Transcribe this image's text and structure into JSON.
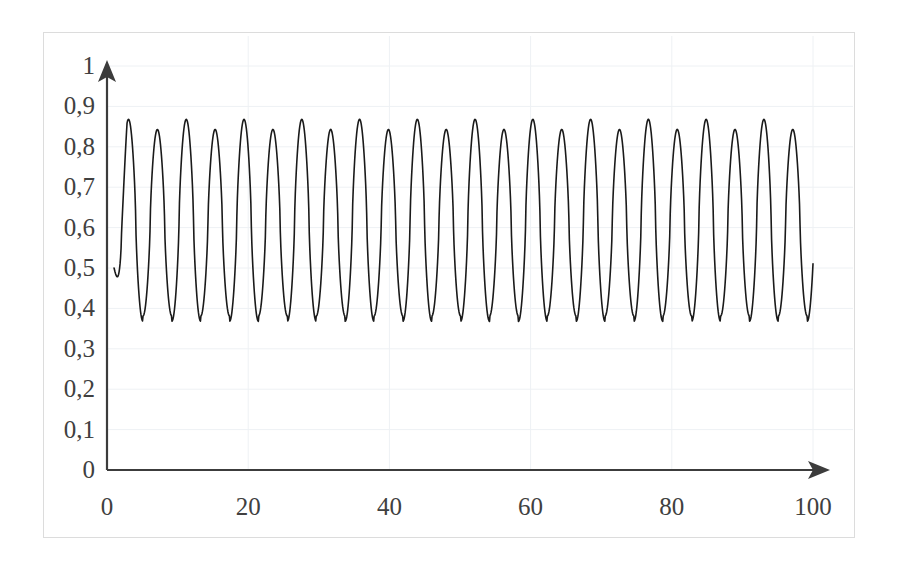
{
  "chart_data": {
    "type": "line",
    "title": "",
    "subtitle": "",
    "xlabel": "",
    "ylabel": "",
    "xlim": [
      0,
      100
    ],
    "ylim": [
      0,
      1
    ],
    "grid": true,
    "legend": false,
    "legend_position": "none",
    "y_tick_labels": [
      "1",
      "0,9",
      "0,8",
      "0,7",
      "0,6",
      "0,5",
      "0,4",
      "0,3",
      "0,2",
      "0,1",
      "0"
    ],
    "y_tick_values": [
      1,
      0.9,
      0.8,
      0.7,
      0.6,
      0.5,
      0.4,
      0.3,
      0.2,
      0.1,
      0
    ],
    "x_tick_labels": [
      "0",
      "20",
      "40",
      "60",
      "80",
      "100"
    ],
    "x_tick_values": [
      0,
      20,
      40,
      60,
      80,
      100
    ],
    "decimal_separator": ",",
    "axis_arrows": {
      "x_axis_arrow": true,
      "y_axis_arrow": true
    },
    "series": [
      {
        "name": "oscillation",
        "color": "#1a1a1a",
        "line_width": 1.6,
        "description": "period-2 oscillation with alternating high and low peaks",
        "start_value": 0.5,
        "end_value": 0.81,
        "peak_high": 0.868,
        "peak_low": 0.843,
        "trough_high": 0.381,
        "trough_low": 0.368,
        "cycles": 24.2,
        "x_start": 1.0,
        "x_end": 100.0,
        "samples": 1400
      }
    ]
  },
  "axes": {
    "x_axis_color": "#3c3c3c",
    "y_axis_color": "#3c3c3c",
    "grid_color": "#eef1f4",
    "frame_color": "#dcdcdc",
    "tick_text_color": "#404040"
  }
}
